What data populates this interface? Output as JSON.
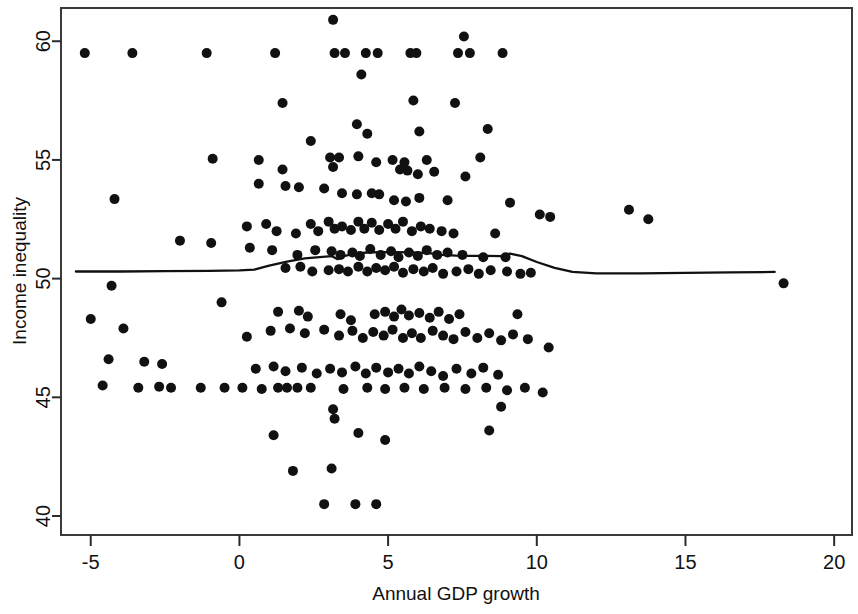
{
  "chart_data": {
    "type": "scatter",
    "title": "",
    "xlabel": "Annual GDP growth",
    "ylabel": "Income inequality",
    "xlim": [
      -6.0,
      20.6
    ],
    "ylim": [
      39.2,
      61.4
    ],
    "xticks": [
      -5,
      0,
      5,
      10,
      15,
      20
    ],
    "xtick_labels": [
      "-5",
      "0",
      "5",
      "10",
      "15",
      "20"
    ],
    "yticks": [
      40,
      45,
      50,
      55,
      60
    ],
    "ytick_labels": [
      "40",
      "45",
      "50",
      "55",
      "60"
    ],
    "grid": "horizontal",
    "legend": "none",
    "marker": "filled-circle",
    "marker_color": "#111111",
    "marker_size_px": 10,
    "series": [
      {
        "name": "Countries",
        "type": "scatter",
        "points": [
          [
            -5.2,
            59.5
          ],
          [
            -3.6,
            59.5
          ],
          [
            -1.1,
            59.5
          ],
          [
            1.2,
            59.5
          ],
          [
            3.2,
            59.5
          ],
          [
            3.55,
            59.5
          ],
          [
            4.25,
            59.5
          ],
          [
            4.65,
            59.5
          ],
          [
            5.75,
            59.5
          ],
          [
            5.95,
            59.5
          ],
          [
            7.35,
            59.5
          ],
          [
            7.75,
            59.5
          ],
          [
            8.85,
            59.5
          ],
          [
            3.15,
            60.9
          ],
          [
            7.55,
            60.2
          ],
          [
            4.1,
            58.6
          ],
          [
            1.45,
            57.4
          ],
          [
            5.85,
            57.5
          ],
          [
            7.25,
            57.4
          ],
          [
            3.95,
            56.5
          ],
          [
            4.3,
            56.1
          ],
          [
            6.05,
            56.2
          ],
          [
            8.35,
            56.3
          ],
          [
            2.4,
            55.8
          ],
          [
            3.35,
            55.1
          ],
          [
            3.05,
            55.1
          ],
          [
            4.0,
            55.15
          ],
          [
            5.15,
            55.0
          ],
          [
            5.55,
            54.9
          ],
          [
            6.3,
            55.0
          ],
          [
            8.1,
            55.1
          ],
          [
            -0.9,
            55.05
          ],
          [
            0.65,
            55.0
          ],
          [
            1.45,
            54.6
          ],
          [
            3.15,
            54.7
          ],
          [
            4.6,
            54.9
          ],
          [
            5.4,
            54.6
          ],
          [
            5.65,
            54.55
          ],
          [
            6.0,
            54.4
          ],
          [
            6.55,
            54.5
          ],
          [
            7.6,
            54.3
          ],
          [
            0.65,
            54.0
          ],
          [
            1.55,
            53.9
          ],
          [
            2.0,
            53.85
          ],
          [
            2.85,
            53.8
          ],
          [
            3.45,
            53.6
          ],
          [
            3.95,
            53.55
          ],
          [
            4.45,
            53.6
          ],
          [
            4.7,
            53.55
          ],
          [
            5.2,
            53.3
          ],
          [
            5.6,
            53.25
          ],
          [
            6.05,
            53.4
          ],
          [
            7.0,
            53.3
          ],
          [
            9.1,
            53.2
          ],
          [
            10.1,
            52.7
          ],
          [
            10.45,
            52.6
          ],
          [
            13.1,
            52.9
          ],
          [
            13.75,
            52.5
          ],
          [
            -4.2,
            53.35
          ],
          [
            -2.0,
            51.6
          ],
          [
            -0.95,
            51.5
          ],
          [
            0.25,
            52.2
          ],
          [
            0.9,
            52.3
          ],
          [
            1.25,
            52.0
          ],
          [
            1.9,
            51.9
          ],
          [
            2.4,
            52.3
          ],
          [
            2.65,
            52.0
          ],
          [
            3.0,
            52.4
          ],
          [
            3.2,
            52.1
          ],
          [
            3.45,
            52.2
          ],
          [
            3.75,
            52.05
          ],
          [
            4.0,
            52.4
          ],
          [
            4.2,
            52.1
          ],
          [
            4.45,
            52.35
          ],
          [
            4.7,
            52.05
          ],
          [
            5.0,
            52.3
          ],
          [
            5.25,
            52.1
          ],
          [
            5.5,
            52.4
          ],
          [
            5.8,
            52.0
          ],
          [
            6.1,
            52.2
          ],
          [
            6.4,
            52.1
          ],
          [
            6.8,
            52.0
          ],
          [
            7.2,
            51.9
          ],
          [
            8.6,
            51.9
          ],
          [
            0.35,
            51.3
          ],
          [
            1.1,
            51.2
          ],
          [
            1.95,
            51.0
          ],
          [
            2.55,
            51.2
          ],
          [
            3.1,
            51.15
          ],
          [
            3.4,
            51.0
          ],
          [
            3.8,
            51.1
          ],
          [
            4.05,
            50.95
          ],
          [
            4.4,
            51.25
          ],
          [
            4.75,
            51.0
          ],
          [
            5.1,
            51.15
          ],
          [
            5.35,
            50.9
          ],
          [
            5.7,
            51.1
          ],
          [
            6.0,
            50.95
          ],
          [
            6.3,
            51.2
          ],
          [
            6.65,
            51.0
          ],
          [
            7.0,
            51.1
          ],
          [
            7.5,
            51.0
          ],
          [
            8.2,
            50.9
          ],
          [
            8.95,
            50.9
          ],
          [
            1.55,
            50.45
          ],
          [
            2.05,
            50.5
          ],
          [
            2.45,
            50.3
          ],
          [
            3.0,
            50.35
          ],
          [
            3.35,
            50.4
          ],
          [
            3.65,
            50.3
          ],
          [
            4.0,
            50.5
          ],
          [
            4.3,
            50.3
          ],
          [
            4.6,
            50.45
          ],
          [
            4.9,
            50.35
          ],
          [
            5.2,
            50.5
          ],
          [
            5.5,
            50.25
          ],
          [
            5.85,
            50.4
          ],
          [
            6.2,
            50.3
          ],
          [
            6.5,
            50.45
          ],
          [
            6.85,
            50.2
          ],
          [
            7.3,
            50.3
          ],
          [
            7.7,
            50.4
          ],
          [
            8.05,
            50.2
          ],
          [
            8.45,
            50.35
          ],
          [
            9.0,
            50.3
          ],
          [
            9.45,
            50.2
          ],
          [
            9.8,
            50.25
          ],
          [
            18.3,
            49.8
          ],
          [
            -4.3,
            49.7
          ],
          [
            -0.6,
            49.0
          ],
          [
            1.3,
            48.6
          ],
          [
            2.0,
            48.65
          ],
          [
            2.3,
            48.4
          ],
          [
            3.4,
            48.5
          ],
          [
            3.75,
            48.25
          ],
          [
            4.55,
            48.5
          ],
          [
            4.9,
            48.6
          ],
          [
            5.2,
            48.4
          ],
          [
            5.45,
            48.7
          ],
          [
            5.7,
            48.45
          ],
          [
            6.05,
            48.55
          ],
          [
            6.4,
            48.35
          ],
          [
            6.7,
            48.6
          ],
          [
            7.05,
            48.3
          ],
          [
            7.4,
            48.5
          ],
          [
            9.35,
            48.5
          ],
          [
            -5.0,
            48.3
          ],
          [
            -3.9,
            47.9
          ],
          [
            0.25,
            47.55
          ],
          [
            1.05,
            47.8
          ],
          [
            1.7,
            47.9
          ],
          [
            2.2,
            47.7
          ],
          [
            2.85,
            47.85
          ],
          [
            3.35,
            47.6
          ],
          [
            3.8,
            47.8
          ],
          [
            4.15,
            47.5
          ],
          [
            4.5,
            47.75
          ],
          [
            4.85,
            47.6
          ],
          [
            5.15,
            47.85
          ],
          [
            5.5,
            47.5
          ],
          [
            5.8,
            47.7
          ],
          [
            6.1,
            47.5
          ],
          [
            6.5,
            47.8
          ],
          [
            6.85,
            47.6
          ],
          [
            7.2,
            47.45
          ],
          [
            7.6,
            47.75
          ],
          [
            8.0,
            47.5
          ],
          [
            8.4,
            47.7
          ],
          [
            8.8,
            47.4
          ],
          [
            9.2,
            47.65
          ],
          [
            9.7,
            47.45
          ],
          [
            10.4,
            47.1
          ],
          [
            -4.4,
            46.6
          ],
          [
            -3.2,
            46.5
          ],
          [
            -2.6,
            46.4
          ],
          [
            0.55,
            46.2
          ],
          [
            1.15,
            46.3
          ],
          [
            1.55,
            46.1
          ],
          [
            2.1,
            46.25
          ],
          [
            2.6,
            46.0
          ],
          [
            3.05,
            46.2
          ],
          [
            3.45,
            46.05
          ],
          [
            3.9,
            46.3
          ],
          [
            4.25,
            46.0
          ],
          [
            4.6,
            46.25
          ],
          [
            5.0,
            46.05
          ],
          [
            5.35,
            46.2
          ],
          [
            5.7,
            46.0
          ],
          [
            6.05,
            46.3
          ],
          [
            6.45,
            46.1
          ],
          [
            6.85,
            45.9
          ],
          [
            7.3,
            46.2
          ],
          [
            7.8,
            46.0
          ],
          [
            8.2,
            46.25
          ],
          [
            8.7,
            45.95
          ],
          [
            -4.6,
            45.5
          ],
          [
            -3.4,
            45.4
          ],
          [
            -2.7,
            45.45
          ],
          [
            -2.3,
            45.4
          ],
          [
            -1.3,
            45.4
          ],
          [
            -0.5,
            45.4
          ],
          [
            0.1,
            45.4
          ],
          [
            0.75,
            45.35
          ],
          [
            1.3,
            45.4
          ],
          [
            1.6,
            45.4
          ],
          [
            1.95,
            45.4
          ],
          [
            2.4,
            45.4
          ],
          [
            3.5,
            45.35
          ],
          [
            4.3,
            45.4
          ],
          [
            4.9,
            45.35
          ],
          [
            5.55,
            45.4
          ],
          [
            6.2,
            45.35
          ],
          [
            6.9,
            45.4
          ],
          [
            7.6,
            45.35
          ],
          [
            8.3,
            45.4
          ],
          [
            9.0,
            45.3
          ],
          [
            9.6,
            45.4
          ],
          [
            10.2,
            45.2
          ],
          [
            3.15,
            44.5
          ],
          [
            3.2,
            44.1
          ],
          [
            8.8,
            44.6
          ],
          [
            1.15,
            43.4
          ],
          [
            4.0,
            43.5
          ],
          [
            4.9,
            43.2
          ],
          [
            8.4,
            43.6
          ],
          [
            1.8,
            41.9
          ],
          [
            3.1,
            42.0
          ],
          [
            2.85,
            40.5
          ],
          [
            3.9,
            40.5
          ],
          [
            4.6,
            40.5
          ]
        ]
      },
      {
        "name": "Lowess smoother",
        "type": "line",
        "color": "#111111",
        "points": [
          [
            -5.5,
            50.3
          ],
          [
            -4.0,
            50.3
          ],
          [
            -2.5,
            50.32
          ],
          [
            -1.0,
            50.33
          ],
          [
            0.0,
            50.35
          ],
          [
            0.5,
            50.38
          ],
          [
            1.0,
            50.55
          ],
          [
            1.6,
            50.72
          ],
          [
            2.2,
            50.85
          ],
          [
            2.8,
            50.92
          ],
          [
            3.1,
            50.95
          ],
          [
            3.3,
            50.82
          ],
          [
            3.5,
            50.95
          ],
          [
            3.9,
            51.05
          ],
          [
            4.3,
            51.1
          ],
          [
            4.8,
            51.12
          ],
          [
            5.3,
            51.12
          ],
          [
            5.8,
            51.1
          ],
          [
            6.3,
            51.08
          ],
          [
            6.8,
            51.0
          ],
          [
            7.3,
            50.97
          ],
          [
            7.8,
            50.96
          ],
          [
            8.3,
            50.96
          ],
          [
            8.8,
            50.95
          ],
          [
            9.1,
            51.05
          ],
          [
            9.5,
            50.95
          ],
          [
            10.0,
            50.7
          ],
          [
            10.6,
            50.45
          ],
          [
            11.2,
            50.28
          ],
          [
            12.0,
            50.22
          ],
          [
            13.5,
            50.22
          ],
          [
            15.0,
            50.24
          ],
          [
            16.5,
            50.26
          ],
          [
            18.0,
            50.28
          ]
        ]
      }
    ]
  },
  "axes": {
    "frame_color": "#3a3a3a",
    "grid_color": "#e8e8ea",
    "text_color": "#111111"
  }
}
